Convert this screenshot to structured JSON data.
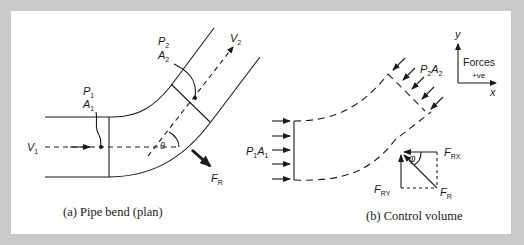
{
  "figure": {
    "background_color": "#c9c9c9",
    "panel_color": "#ffffff",
    "ink_color": "#1a1a1a"
  },
  "panel_a": {
    "caption": "(a) Pipe bend (plan)",
    "labels": {
      "P1": "P",
      "P1_sub": "1",
      "A1": "A",
      "A1_sub": "1",
      "P2": "P",
      "P2_sub": "2",
      "A2": "A",
      "A2_sub": "2",
      "V1": "V",
      "V1_sub": "1",
      "V2": "V",
      "V2_sub": "2",
      "theta": "θ",
      "FR": "F",
      "FR_sub": "R"
    }
  },
  "panel_b": {
    "caption": "(b) Control volume",
    "labels": {
      "P1A1_P": "P",
      "P1A1_P_sub": "1",
      "P1A1_A": "A",
      "P1A1_A_sub": "1",
      "P2A2_P": "P",
      "P2A2_P_sub": "2",
      "P2A2_A": "A",
      "P2A2_A_sub": "2",
      "FRX": "F",
      "FRX_sub": "RX",
      "FRY": "F",
      "FRY_sub": "RY",
      "FR": "F",
      "FR_sub": "R",
      "phi": "φ"
    },
    "axes": {
      "y_label": "y",
      "x_label": "x",
      "forces_label": "Forces",
      "positive_label": "+ve"
    }
  }
}
